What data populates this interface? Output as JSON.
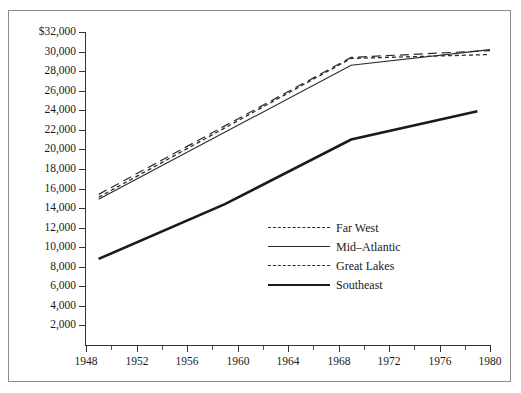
{
  "caption_remnant": "",
  "chart_data": {
    "type": "line",
    "title": "",
    "subtitle": "",
    "xlabel": "",
    "ylabel": "",
    "xlim": [
      1948,
      1980
    ],
    "ylim": [
      0,
      32000
    ],
    "grid": false,
    "legend_position": "center",
    "x_tick_labels": [
      "1948",
      "1952",
      "1956",
      "1960",
      "1964",
      "1968",
      "1972",
      "1976",
      "1980"
    ],
    "x_ticks_major": [
      1948,
      1952,
      1956,
      1960,
      1964,
      1968,
      1972,
      1976,
      1980
    ],
    "x_ticks_minor": [
      1950,
      1954,
      1958,
      1962,
      1966,
      1970,
      1974,
      1978
    ],
    "y_tick_labels": [
      "$32,000",
      "30,000",
      "28,000",
      "26,000",
      "24,000",
      "22,000",
      "20,000",
      "18,000",
      "16,000",
      "14,000",
      "12,000",
      "10,000",
      "8,000",
      "6,000",
      "4,000",
      "2,000"
    ],
    "y_ticks": [
      32000,
      30000,
      28000,
      26000,
      24000,
      22000,
      20000,
      18000,
      16000,
      14000,
      12000,
      10000,
      8000,
      6000,
      4000,
      2000
    ],
    "series": [
      {
        "name": "Far West",
        "style": "long-dash",
        "color": "#2b2b2b",
        "width": 1.2,
        "x": [
          1949,
          1969,
          1980
        ],
        "values": [
          15400,
          29400,
          30100
        ]
      },
      {
        "name": "Mid-Atlantic",
        "style": "solid-thin",
        "color": "#2b2b2b",
        "width": 1.1,
        "x": [
          1949,
          1969,
          1980
        ],
        "values": [
          14900,
          28600,
          30200
        ]
      },
      {
        "name": "Great Lakes",
        "style": "short-dash",
        "color": "#2b2b2b",
        "width": 1.3,
        "x": [
          1949,
          1969,
          1980
        ],
        "values": [
          15100,
          29300,
          29700
        ]
      },
      {
        "name": "Southeast",
        "style": "solid-thick",
        "color": "#1a1a1a",
        "width": 2.6,
        "x": [
          1949,
          1959,
          1969,
          1979
        ],
        "values": [
          8800,
          14400,
          21000,
          23900
        ]
      }
    ]
  },
  "legend": {
    "items": [
      {
        "label": "Far West",
        "style": "long-dash"
      },
      {
        "label": "Mid–Atlantic",
        "style": "solid-thin"
      },
      {
        "label": "Great Lakes",
        "style": "short-dash"
      },
      {
        "label": "Southeast",
        "style": "solid-thick"
      }
    ]
  }
}
